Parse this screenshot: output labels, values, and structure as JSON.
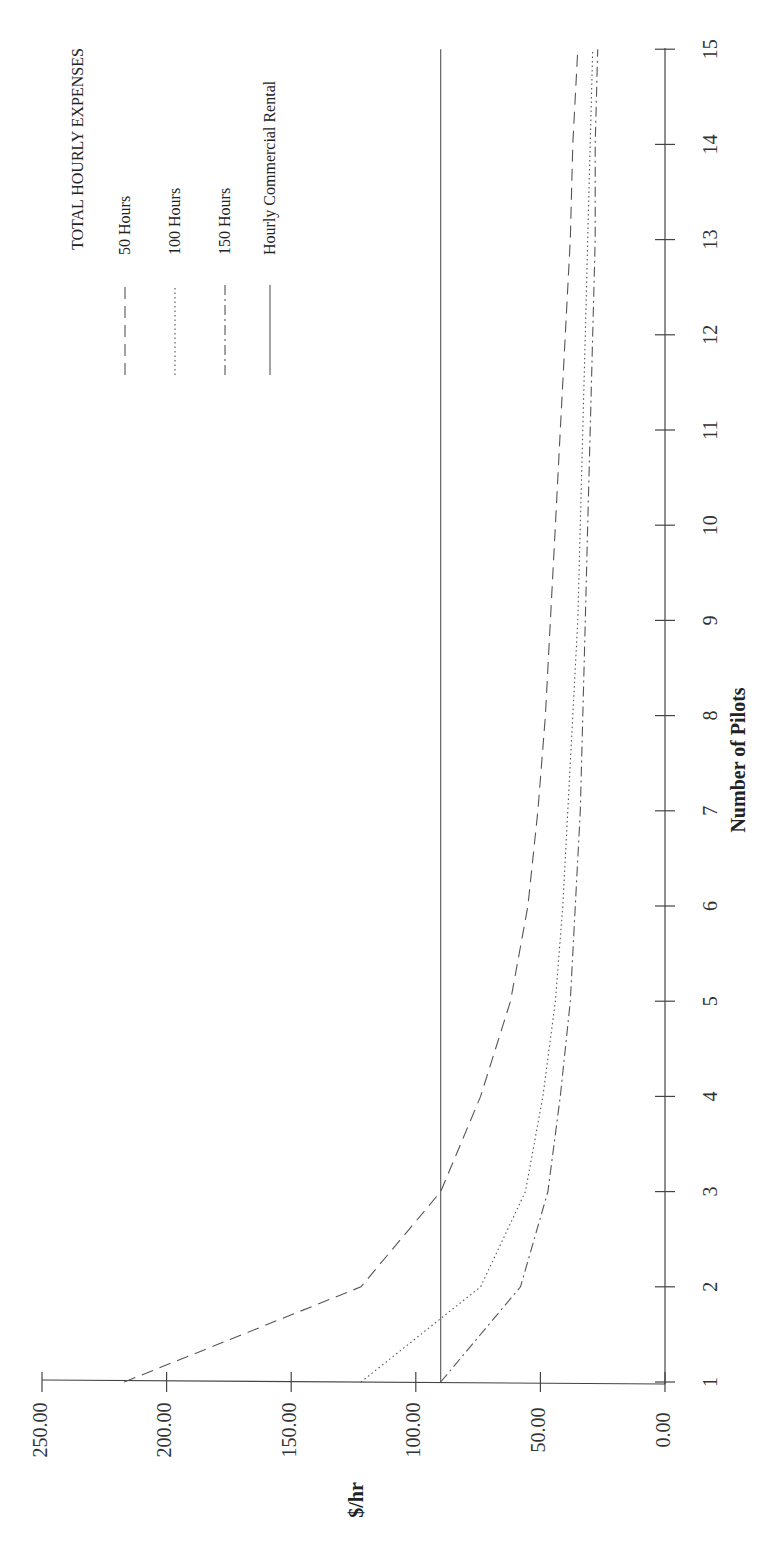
{
  "chart_data": {
    "type": "line",
    "orientation": "rotated-90-ccw",
    "title": "TOTAL HOURLY EXPENSES",
    "xlabel": "Number of Pilots",
    "ylabel": "$/hr",
    "x": [
      1,
      2,
      3,
      4,
      5,
      6,
      7,
      8,
      9,
      10,
      11,
      12,
      13,
      14,
      15
    ],
    "x_tick_labels": [
      "1",
      "2",
      "3",
      "4",
      "5",
      "6",
      "7",
      "8",
      "9",
      "10",
      "11",
      "12",
      "13",
      "14",
      "15"
    ],
    "y_tick_labels": [
      "0.00",
      "50.00",
      "100.00",
      "150.00",
      "200.00",
      "250.00"
    ],
    "y_ticks": [
      0,
      50,
      100,
      150,
      200,
      250
    ],
    "ylim": [
      0,
      250
    ],
    "xlim": [
      1,
      15
    ],
    "grid": false,
    "legend_position": "upper-right (rotated)",
    "series": [
      {
        "name": "50 Hours",
        "style": "dashed",
        "values": [
          217,
          122,
          90,
          74,
          62,
          55,
          51,
          48,
          46,
          44,
          42,
          40,
          38,
          37,
          35
        ]
      },
      {
        "name": "100 Hours",
        "style": "dotted",
        "values": [
          122,
          74,
          56,
          49,
          44,
          41,
          39,
          37,
          35,
          34,
          33,
          32,
          31,
          30,
          29
        ]
      },
      {
        "name": "150 Hours",
        "style": "dash-dot",
        "values": [
          90,
          58,
          47,
          42,
          38,
          36,
          34,
          33,
          32,
          31,
          30,
          29,
          28,
          28,
          27
        ]
      },
      {
        "name": "Hourly Commercial Rental",
        "style": "solid",
        "values": [
          90,
          90,
          90,
          90,
          90,
          90,
          90,
          90,
          90,
          90,
          90,
          90,
          90,
          90,
          90
        ]
      }
    ]
  },
  "legend": {
    "title": "TOTAL HOURLY EXPENSES",
    "items": [
      {
        "label": "50 Hours",
        "style": "dashed"
      },
      {
        "label": "100 Hours",
        "style": "dotted"
      },
      {
        "label": "150 Hours",
        "style": "dash-dot"
      },
      {
        "label": "Hourly Commercial Rental",
        "style": "solid"
      }
    ]
  },
  "axes": {
    "x_title": "Number of Pilots",
    "y_title": "$/hr"
  },
  "colors": {
    "line": "#555555",
    "axis": "#444444",
    "text": "#222222",
    "background": "#ffffff"
  }
}
